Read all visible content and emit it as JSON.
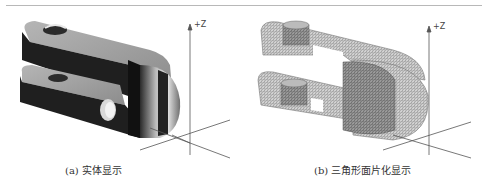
{
  "figure": {
    "panels": [
      {
        "id": "a",
        "caption": "(a) 实体显示",
        "axis_label": "+Z",
        "render_mode": "solid"
      },
      {
        "id": "b",
        "caption": "(b) 三角形面片化显示",
        "axis_label": "+Z",
        "render_mode": "triangulated-mesh"
      }
    ]
  },
  "colors": {
    "rule": "#b8b8b8",
    "solid_dark": "#1f1f1f",
    "solid_light": "#c8c8c8",
    "mesh": "#8a8a8a",
    "axis": "#555555"
  }
}
